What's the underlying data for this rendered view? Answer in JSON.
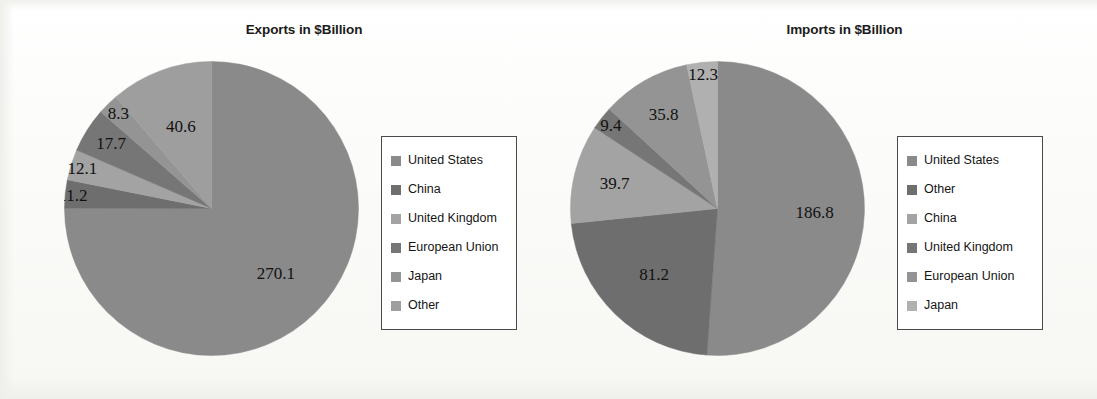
{
  "page": {
    "background_color": "#fcfcfa"
  },
  "charts": [
    {
      "id": "exports",
      "title": "Exports in $Billion",
      "legend": {
        "items": [
          {
            "label": "United States",
            "color": "#8a8a8a"
          },
          {
            "label": "China",
            "color": "#6e6e6e"
          },
          {
            "label": "United Kingdom",
            "color": "#a3a3a3"
          },
          {
            "label": "European Union",
            "color": "#767676"
          },
          {
            "label": "Japan",
            "color": "#949494"
          },
          {
            "label": "Other",
            "color": "#9e9e9e"
          }
        ]
      }
    },
    {
      "id": "imports",
      "title": "Imports in $Billion",
      "legend": {
        "items": [
          {
            "label": "United States",
            "color": "#8a8a8a"
          },
          {
            "label": "Other",
            "color": "#6e6e6e"
          },
          {
            "label": "China",
            "color": "#a3a3a3"
          },
          {
            "label": "United Kingdom",
            "color": "#767676"
          },
          {
            "label": "European Union",
            "color": "#949494"
          },
          {
            "label": "Japan",
            "color": "#b0b0b0"
          }
        ]
      }
    }
  ],
  "chart_data": [
    {
      "type": "pie",
      "id": "exports",
      "title": "Exports in $Billion",
      "unit": "$Billion",
      "start_angle_deg": 0,
      "direction": "clockwise",
      "categories": [
        "United States",
        "China",
        "United Kingdom",
        "European Union",
        "Japan",
        "Other"
      ],
      "values": [
        270.1,
        11.2,
        12.1,
        17.7,
        8.3,
        40.6
      ],
      "labels": [
        "270.1",
        "11.2",
        "12.1",
        "17.7",
        "8.3",
        "40.6"
      ],
      "colors": [
        "#8a8a8a",
        "#6e6e6e",
        "#a3a3a3",
        "#767676",
        "#949494",
        "#9e9e9e"
      ],
      "total": 360.0,
      "legend_position": "right"
    },
    {
      "type": "pie",
      "id": "imports",
      "title": "Imports in $Billion",
      "unit": "$Billion",
      "start_angle_deg": 0,
      "direction": "clockwise",
      "categories": [
        "United States",
        "Other",
        "China",
        "United Kingdom",
        "European Union",
        "Japan"
      ],
      "values": [
        186.8,
        81.2,
        39.7,
        9.4,
        35.8,
        12.3
      ],
      "labels": [
        "186.8",
        "81.2",
        "39.7",
        "9.4",
        "35.8",
        "12.3"
      ],
      "colors": [
        "#8a8a8a",
        "#6e6e6e",
        "#a3a3a3",
        "#767676",
        "#949494",
        "#b0b0b0"
      ],
      "total": 365.2,
      "legend_position": "right"
    }
  ]
}
